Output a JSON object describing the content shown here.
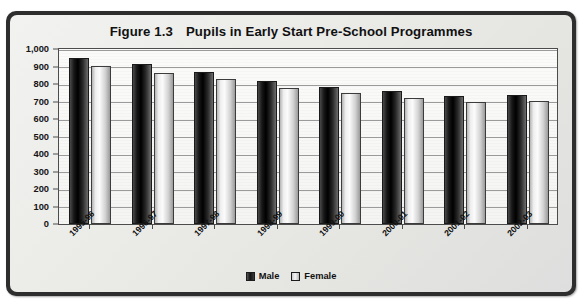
{
  "figure": {
    "number": "Figure 1.3",
    "title": "Pupils in Early Start Pre-School Programmes"
  },
  "legend": {
    "position": "bottom-center",
    "items": [
      {
        "label": "Male",
        "swatch": "dark-gradient-swatch",
        "color": "#121212"
      },
      {
        "label": "Female",
        "swatch": "light-gradient-swatch",
        "color": "#d8d8d8"
      }
    ]
  },
  "axes": {
    "y_ticks": [
      "0",
      "100",
      "200",
      "300",
      "400",
      "500",
      "600",
      "700",
      "800",
      "900",
      "1,000"
    ],
    "x_ticks": [
      "1995-96",
      "1996-97",
      "1997-98",
      "1998-99",
      "1999-00",
      "2000-01",
      "2001-02",
      "2002-03"
    ]
  },
  "chart_data": {
    "type": "bar",
    "xlabel": "",
    "ylabel": "",
    "ylim": [
      0,
      1000
    ],
    "ytick_step": 100,
    "grid": true,
    "legend_position": "bottom-center",
    "categories": [
      "1995-96",
      "1996-97",
      "1997-98",
      "1998-99",
      "1999-00",
      "2000-01",
      "2001-02",
      "2002-03"
    ],
    "series": [
      {
        "name": "Male",
        "values": [
          950,
          915,
          870,
          820,
          785,
          758,
          730,
          740
        ]
      },
      {
        "name": "Female",
        "values": [
          905,
          865,
          830,
          780,
          750,
          718,
          695,
          705
        ]
      }
    ]
  }
}
